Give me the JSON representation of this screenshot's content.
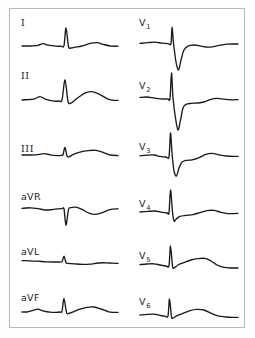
{
  "figure": {
    "kind": "12-lead-electrocardiogram",
    "background_color": "#ffffff",
    "frame_color": "#b9b9b9",
    "trace_color": "#1a1a1a",
    "label_color": "#1a1a1a",
    "columns": 2,
    "rows_per_column": 6
  },
  "chart_data": {
    "type": "line",
    "title": "",
    "xlabel": "",
    "ylabel": "",
    "grid": false,
    "legend": false,
    "series": [
      {
        "name": "I",
        "label": "I",
        "column": "left",
        "row": 1,
        "baseline_y": 46,
        "x_start": 22,
        "x_end": 118,
        "morphology": "small upright P, tall narrow R, broad upright T",
        "points": "22,46 30,46 38,45.4 43,43.6 48,45.2 56,46.2 61,46.2 64,45.6 66,28 68.5,46.5 71,48 75,47.2 82,46 90,43.4 97,42.6 104,44.6 111,46.1 118,46.2"
      },
      {
        "name": "II",
        "label": "II",
        "column": "left",
        "row": 2,
        "baseline_y": 100,
        "x_start": 22,
        "x_end": 118,
        "morphology": "upright P, tall R, prominent upright T",
        "points": "22,100 28,99.6 34,99.2 40,96.6 46,99.4 54,101.2 59,101 62,100 65,80 68,101.5 71,103 75,100 80,96.2 86,92.6 93,91.8 100,94.6 107,98.6 112,100.2 118,100.4"
      },
      {
        "name": "III",
        "label": "III",
        "column": "left",
        "row": 3,
        "baseline_y": 155,
        "x_start": 22,
        "x_end": 118,
        "morphology": "low voltage, small R, broad low-amplitude T",
        "points": "22,155 30,155 38,154.6 44,153.6 50,154.8 57,155.6 61,155.4 63,154.6 65,147.4 67,156 69,156.8 73,154.6 80,152.2 88,150.6 96,150.4 103,152.4 110,155 118,155.6"
      },
      {
        "name": "aVR",
        "label": "aVR",
        "column": "left",
        "row": 4,
        "baseline_y": 209,
        "x_start": 22,
        "x_end": 118,
        "morphology": "inverted complex: negative QRS spike and inverted T",
        "points": "22,208.4 30,207.8 38,208.6 45,210 52,209.6 58,208.8 62,208.6 64,209 66,225.4 68.5,209.6 71,207.6 76,207.2 82,209.4 89,213.2 96,214.4 103,212.4 110,209.6 118,208.8"
      },
      {
        "name": "aVL",
        "label": "aVL",
        "column": "left",
        "row": 5,
        "baseline_y": 261,
        "x_start": 22,
        "x_end": 118,
        "morphology": "low voltage, small narrow R, nearly flat T",
        "points": "22,260.6 30,260.8 38,261.2 46,261.8 54,262 59,262 62,261.6 64,256.2 66,262.6 68,263.4 74,263.8 82,264.4 90,264.2 98,263 106,262.8 112,263.2 118,263.4"
      },
      {
        "name": "aVF",
        "label": "aVF",
        "column": "left",
        "row": 6,
        "baseline_y": 312,
        "x_start": 22,
        "x_end": 118,
        "morphology": "upright P, tall narrow R, modest upright T",
        "points": "22,312 28,311.8 33,310.4 38,309.2 43,310.8 50,312.2 56,312.4 60,312 62,311.4 64,298.6 66.5,312.4 69,313.4 74,311.6 80,309.2 87,307.4 94,307 101,309 108,311.6 113,312.4 118,312.4"
      },
      {
        "name": "V1",
        "label": "V1",
        "label_main": "V",
        "label_sub": "1",
        "column": "right",
        "row": 1,
        "baseline_y": 43,
        "x_start": 140,
        "x_end": 238,
        "morphology": "tiny r, deep wide S (rS), slow ST recovery with flat T",
        "points": "140,43.4 148,42.6 155,42.2 162,43.2 168,43.6 171,43.6 172,27.2 173.5,43 176,62 178.5,70 181,60 184,50 188,46.2 194,45 200,45.8 206,47 212,46.8 219,45.4 227,44.2 234,44 238,44"
      },
      {
        "name": "V2",
        "label": "V2",
        "label_main": "V",
        "label_sub": "2",
        "column": "right",
        "row": 2,
        "baseline_y": 98,
        "x_start": 140,
        "x_end": 238,
        "morphology": "tall r then very deep S (rS), biphasic ST-T",
        "points": "140,97.4 146,97 152,97.6 158,98.6 164,99 168,99 170,98.4 171.5,73 173,98 175.5,118 178,130 180.5,120 183,108 186,104.4 191,103.4 198,103 204,102 210,99.6 217,98.4 224,99.2 231,99.8 238,99.6"
      },
      {
        "name": "V3",
        "label": "V3",
        "label_main": "V",
        "label_sub": "3",
        "column": "right",
        "row": 3,
        "baseline_y": 155,
        "x_start": 140,
        "x_end": 238,
        "morphology": "transition: tall R with deep S (RS), upright T",
        "points": "140,155.8 147,155.2 154,155 160,156.4 166,157 169,156.8 170.5,133 172,153 174,171 176.5,176 179,168 182,162 186,160.4 192,159.8 198,158.2 205,154.6 212,153.4 219,154.8 227,156 233,156.4 238,156.4"
      },
      {
        "name": "V4",
        "label": "V4",
        "label_main": "V",
        "label_sub": "4",
        "column": "right",
        "row": 4,
        "baseline_y": 212,
        "x_start": 140,
        "x_end": 238,
        "morphology": "tall R with small s, low upright T",
        "points": "140,212 148,211.4 155,211 161,212.2 167,213 169,212.6 170.5,190 172.5,212 174,221 176,219.2 180,216.4 186,215.4 193,214.6 200,212.6 207,210.6 214,210.4 221,212.4 228,213.6 234,213.6 238,213.4"
      },
      {
        "name": "V5",
        "label": "V5",
        "label_main": "V",
        "label_sub": "5",
        "column": "right",
        "row": 5,
        "baseline_y": 265,
        "x_start": 140,
        "x_end": 238,
        "morphology": "tall R, upright rounded T",
        "points": "140,264.6 147,264 154,263.8 160,265 166,266 169,265.6 170.5,246 172.5,266 174,268 178,265 184,262.6 191,260 198,258.6 205,258.4 211,261 217,265 224,267.4 231,268 238,268"
      },
      {
        "name": "V6",
        "label": "V6",
        "label_main": "V",
        "label_sub": "6",
        "column": "right",
        "row": 6,
        "baseline_y": 315,
        "x_start": 140,
        "x_end": 238,
        "morphology": "tall narrow R, broad upright T",
        "points": "140,315 147,314.4 154,314.2 160,315.4 165,316.2 168,316 169.5,299 171.5,316.6 173,318 177,315.6 183,313.4 190,310.6 197,309.4 204,310 211,313.2 218,315.8 226,317 232,317.4 238,317.4"
      }
    ]
  },
  "labels": {
    "limb": [
      {
        "id": "I",
        "text": "I",
        "x": 21,
        "y": 26,
        "style": "roman"
      },
      {
        "id": "II",
        "text": "II",
        "x": 21,
        "y": 79,
        "style": "roman"
      },
      {
        "id": "III",
        "text": "III",
        "x": 21,
        "y": 152,
        "style": "roman"
      },
      {
        "id": "aVR",
        "text": "aVR",
        "x": 21,
        "y": 200,
        "style": "plain"
      },
      {
        "id": "aVL",
        "text": "aVL",
        "x": 21,
        "y": 255,
        "style": "plain"
      },
      {
        "id": "aVF",
        "text": "aVF",
        "x": 21,
        "y": 301,
        "style": "plain"
      }
    ],
    "precordial": [
      {
        "id": "V1",
        "main": "V",
        "sub": "1",
        "x": 139,
        "y": 26
      },
      {
        "id": "V2",
        "main": "V",
        "sub": "2",
        "x": 139,
        "y": 89
      },
      {
        "id": "V3",
        "main": "V",
        "sub": "3",
        "x": 139,
        "y": 150
      },
      {
        "id": "V4",
        "main": "V",
        "sub": "4",
        "x": 139,
        "y": 207
      },
      {
        "id": "V5",
        "main": "V",
        "sub": "5",
        "x": 139,
        "y": 259
      },
      {
        "id": "V6",
        "main": "V",
        "sub": "6",
        "x": 139,
        "y": 305
      }
    ]
  }
}
